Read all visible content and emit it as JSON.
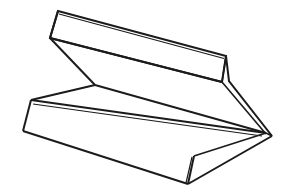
{
  "figure": {
    "background_color": "#ffffff",
    "stroke_color": "#1b1b1b",
    "fill_color": "#ffffff",
    "stroke_width": 2,
    "thin_stroke_width": 1.4,
    "canvas": {
      "width": 286,
      "height": 193
    },
    "vertices": {
      "top_flange_top_left": [
        58,
        11
      ],
      "top_flange_top_right": [
        226,
        56
      ],
      "left_junction": [
        50,
        38
      ],
      "right_fold_upper": [
        222,
        82
      ],
      "right_fold_outer": [
        229,
        81
      ],
      "center_junction": [
        95,
        85
      ],
      "bottom_top_left": [
        31,
        100
      ],
      "bottom_bottom_left": [
        23,
        131
      ],
      "right_point": [
        272,
        136
      ],
      "right_point_inner": [
        266,
        133
      ],
      "bottom_fold_inner": [
        194,
        156
      ],
      "bottom_fold_outer": [
        188,
        184
      ],
      "bottom_fold_outer2": [
        196,
        182
      ]
    },
    "paths": {
      "top_band_outline": "M58,11 L226,56 L222,82 L50,38 Z",
      "top_band_inner_crease": "M50,38 L222,82",
      "top_band_edge_double": "M58.5,12.5 L224.5,57.5",
      "right_flange": "M226,56 L229,81 L272,136 L266,133 L222,82 Z",
      "left_wedge": "M50,38 L95,85 L31,100 Z",
      "diagonal_fold_left": "M50,38 L95,85",
      "center_ridge": "M95,85 L266,133",
      "bottom_band_outline": "M31,100 L266,133 L194,156 L23,131 Z",
      "bottom_band_inner": "M33,103 L263,134",
      "bottom_band_lower_edge": "M23,131 L188,184",
      "bottom_flange": "M194,156 L188,184 L196,182 L272,136 L266,133 Z",
      "bottom_right_edge": "M188,184 L272,136",
      "left_end_cap": "M31,100 L23,131",
      "top_left_cap": "M58,11 L50,38"
    },
    "labels": {
      "caption": ""
    }
  }
}
